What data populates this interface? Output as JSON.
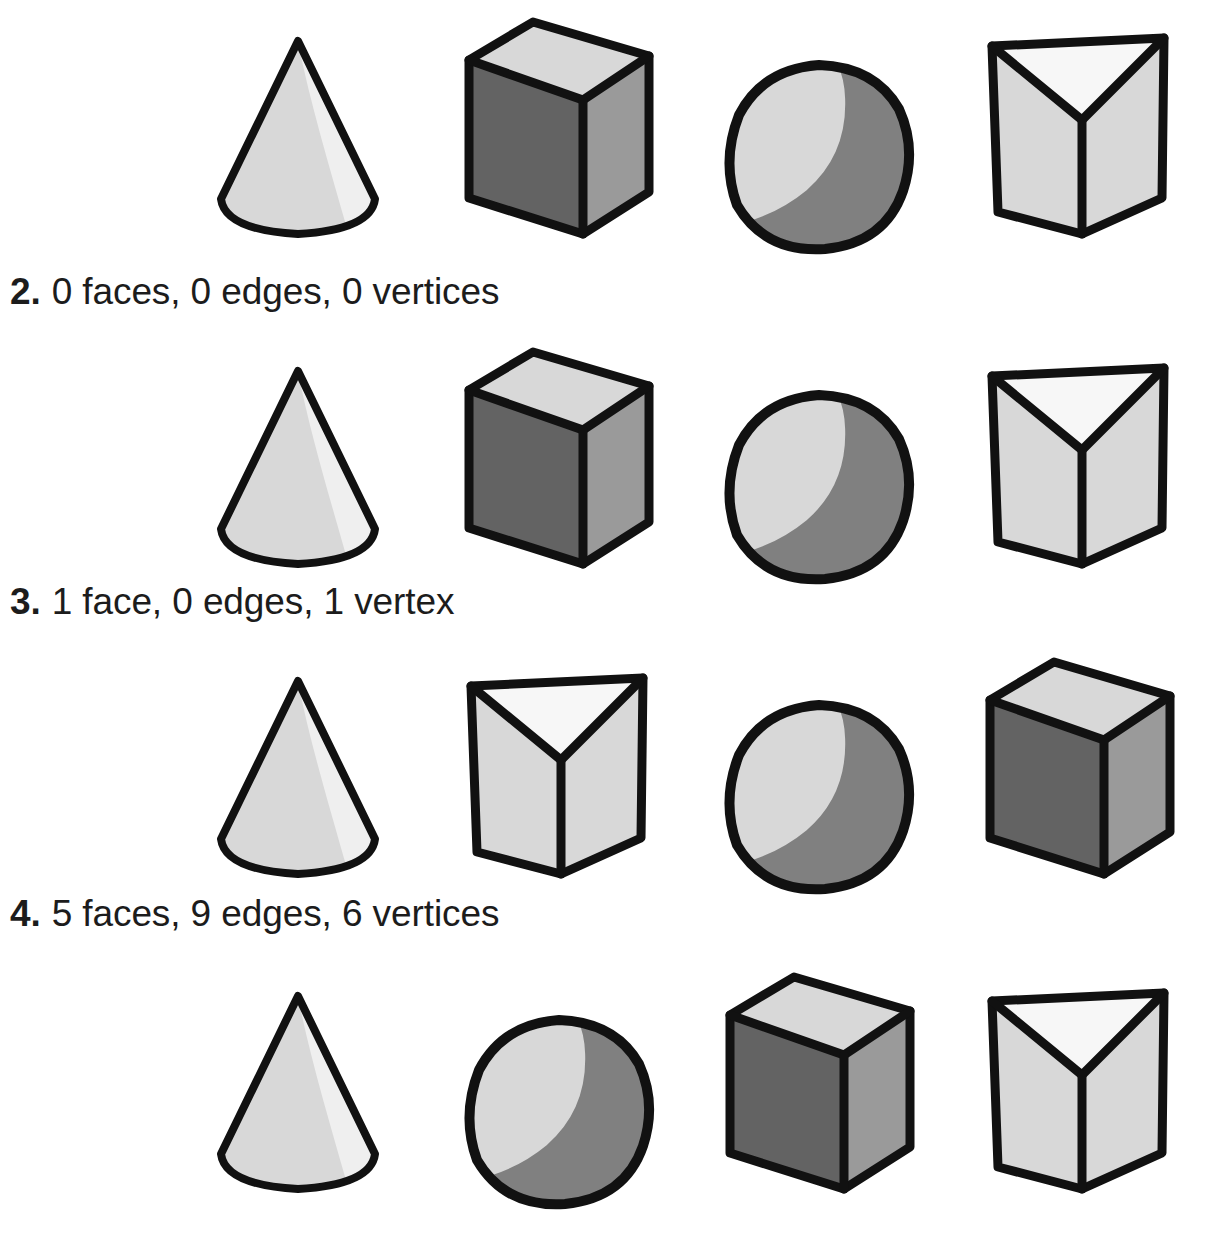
{
  "page": {
    "kind": "math-worksheet"
  },
  "palette": {
    "ink": "#111111",
    "text": "#1c1c1c",
    "paper": "#ffffff",
    "light": "#d8d8d8",
    "lighter": "#e8e8e8",
    "highlight": "#efefef",
    "medium": "#9a9a9a",
    "mediumdark": "#808080",
    "dark": "#636363",
    "white": "#f7f7f7"
  },
  "shape_labels": {
    "cone": "cone",
    "rectangular_prism": "rectangular prism",
    "sphere": "sphere",
    "triangular_prism": "triangular prism"
  },
  "rows": [
    {
      "id": "row-1",
      "shapes": [
        "cone",
        "rectangular_prism",
        "sphere",
        "triangular_prism"
      ]
    },
    {
      "id": "row-2",
      "shapes": [
        "cone",
        "rectangular_prism",
        "sphere",
        "triangular_prism"
      ]
    },
    {
      "id": "row-3",
      "shapes": [
        "cone",
        "triangular_prism",
        "sphere",
        "rectangular_prism"
      ]
    },
    {
      "id": "row-4",
      "shapes": [
        "cone",
        "sphere",
        "rectangular_prism",
        "triangular_prism"
      ]
    }
  ],
  "prompts": [
    {
      "id": "prompt-2",
      "number": "2.",
      "text": "0 faces, 0 edges, 0 vertices"
    },
    {
      "id": "prompt-3",
      "number": "3.",
      "text": "1 face, 0 edges, 1 vertex"
    },
    {
      "id": "prompt-4",
      "number": "4.",
      "text": "5 faces, 9 edges, 6 vertices"
    }
  ]
}
